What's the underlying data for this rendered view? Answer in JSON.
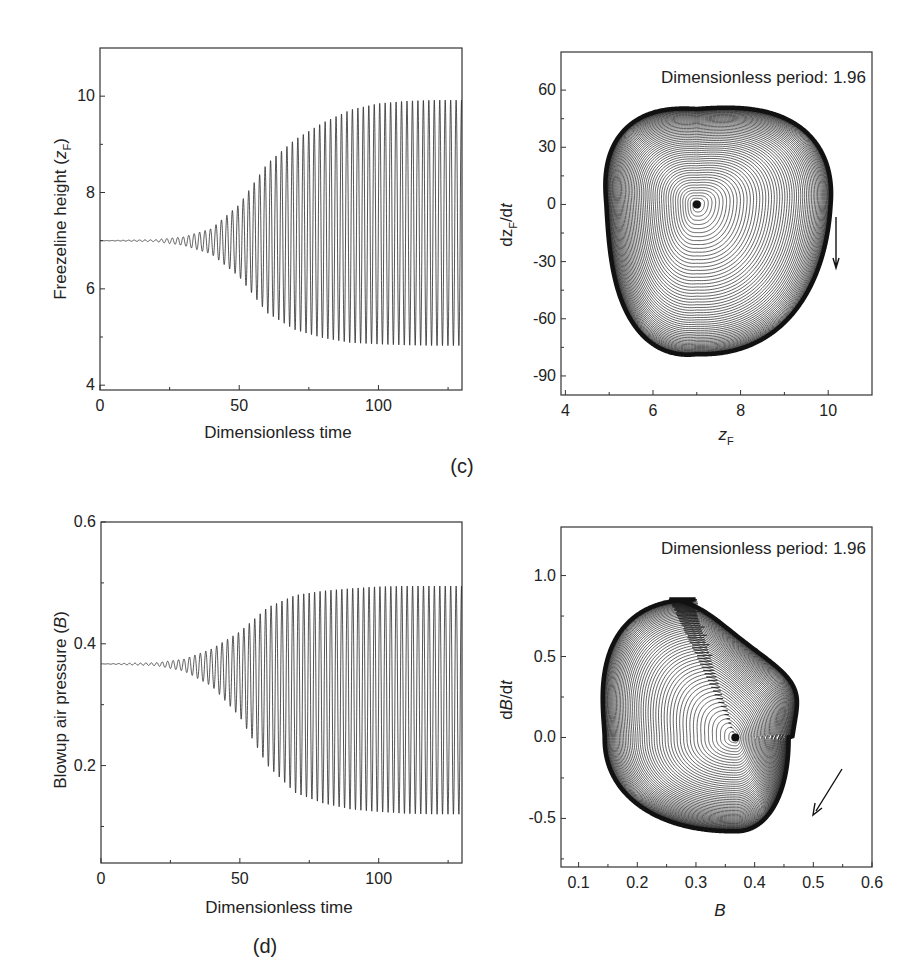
{
  "figure": {
    "panel_labels": [
      "(c)",
      "(d)"
    ]
  },
  "chart_data": [
    {
      "id": "c-left",
      "type": "line",
      "title": "",
      "xlabel": "Dimensionless time",
      "ylabel": "Freezeline height (z_F)",
      "ylabel_main": "Freezeline height (",
      "ylabel_var": "z",
      "ylabel_sub": "F",
      "ylabel_close": ")",
      "xlim": [
        0,
        130
      ],
      "ylim": [
        3.9,
        11
      ],
      "xticks": [
        0,
        50,
        100
      ],
      "yticks": [
        4,
        6,
        8,
        10
      ],
      "grid": false,
      "description": "Growing oscillation around 7, saturating to a limit cycle between ~4.8 and ~9.9",
      "series": [
        {
          "name": "z_F(t)",
          "equilibrium": 7.0,
          "period": 1.96,
          "onset_time": 10,
          "saturation_time": 100,
          "final_max": 9.92,
          "final_min": 4.82,
          "envelope_samples": {
            "t": [
              0,
              20,
              30,
              40,
              50,
              60,
              70,
              80,
              90,
              100,
              110,
              120,
              130
            ],
            "max": [
              7.0,
              7.02,
              7.08,
              7.25,
              7.75,
              8.6,
              9.1,
              9.45,
              9.72,
              9.85,
              9.9,
              9.92,
              9.92
            ],
            "min": [
              7.0,
              6.98,
              6.9,
              6.72,
              6.25,
              5.5,
              5.15,
              4.98,
              4.88,
              4.85,
              4.83,
              4.82,
              4.82
            ]
          }
        }
      ]
    },
    {
      "id": "c-right",
      "type": "line",
      "title": "",
      "annotation": "Dimensionless period: 1.96",
      "xlabel": "z_F",
      "xlabel_var": "z",
      "xlabel_sub": "F",
      "ylabel": "dz_F/dt",
      "ylabel_parts": [
        "dz",
        "F",
        "/d",
        "t"
      ],
      "xlim": [
        3.9,
        11
      ],
      "ylim": [
        -100,
        80
      ],
      "xticks": [
        4,
        6,
        8,
        10
      ],
      "yticks": [
        60,
        30,
        0,
        -30,
        -60,
        -90
      ],
      "grid": false,
      "description": "Phase portrait: spiral outward from fixed point (7, 0) to a rounded-triangle limit cycle",
      "series": [
        {
          "name": "phase trajectory",
          "fixed_point": [
            7.0,
            0
          ],
          "limit_cycle_extent": {
            "z_min": 4.85,
            "z_max": 9.95,
            "dz_max": 51,
            "dz_min": -78
          },
          "direction_arrow": {
            "z": 10.2,
            "from_dz": -8,
            "to_dz": -36,
            "direction": "clockwise"
          }
        }
      ]
    },
    {
      "id": "d-left",
      "type": "line",
      "title": "",
      "xlabel": "Dimensionless time",
      "ylabel": "Blowup air pressure (B)",
      "ylabel_main": "Blowup air pressure (",
      "ylabel_var": "B",
      "ylabel_close": ")",
      "xlim": [
        0,
        130
      ],
      "ylim": [
        0.04,
        0.6
      ],
      "xticks": [
        0,
        50,
        100
      ],
      "yticks": [
        0.2,
        0.4,
        0.6
      ],
      "grid": false,
      "description": "Growing oscillation around 0.367, saturating to a limit cycle between ~0.12 and ~0.50",
      "series": [
        {
          "name": "B(t)",
          "equilibrium": 0.367,
          "period": 1.96,
          "final_max": 0.495,
          "final_min": 0.12,
          "envelope_samples": {
            "t": [
              0,
              20,
              30,
              40,
              50,
              60,
              70,
              80,
              90,
              100,
              110,
              120,
              130
            ],
            "max": [
              0.367,
              0.369,
              0.375,
              0.392,
              0.42,
              0.46,
              0.48,
              0.487,
              0.491,
              0.494,
              0.495,
              0.495,
              0.495
            ],
            "min": [
              0.367,
              0.364,
              0.355,
              0.33,
              0.28,
              0.2,
              0.155,
              0.138,
              0.128,
              0.124,
              0.121,
              0.12,
              0.12
            ]
          }
        }
      ]
    },
    {
      "id": "d-right",
      "type": "line",
      "title": "",
      "annotation": "Dimensionless period: 1.96",
      "xlabel": "B",
      "ylabel": "dB/dt",
      "ylabel_parts": [
        "d",
        "B",
        "/d",
        "t"
      ],
      "xlim": [
        0.07,
        0.6
      ],
      "ylim": [
        -0.8,
        1.3
      ],
      "xticks": [
        0.1,
        0.2,
        0.3,
        0.4,
        0.5,
        0.6
      ],
      "yticks": [
        1.0,
        0.5,
        0.0,
        -0.5
      ],
      "grid": false,
      "description": "Phase portrait: spiral outward from fixed point (0.367, 0) to a lobed limit cycle",
      "series": [
        {
          "name": "phase trajectory",
          "fixed_point": [
            0.367,
            0.0
          ],
          "limit_cycle_extent": {
            "B_min": 0.125,
            "B_max": 0.5,
            "dB_max": 0.92,
            "dB_min": -0.64
          },
          "direction_arrow": {
            "from": [
              0.51,
              -0.18
            ],
            "to": [
              0.46,
              -0.46
            ],
            "direction": "clockwise"
          }
        }
      ]
    }
  ]
}
